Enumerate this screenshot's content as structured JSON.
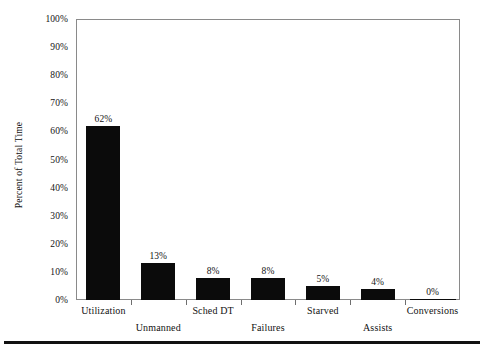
{
  "chart_data": {
    "type": "bar",
    "title": "",
    "subtitle": "",
    "xlabel": "",
    "ylabel": "Percent of Total Time",
    "categories": [
      "Utilization",
      "Unmanned",
      "Sched DT",
      "Failures",
      "Starved",
      "Assists",
      "Conversions"
    ],
    "values": [
      62,
      13,
      8,
      8,
      5,
      4,
      0
    ],
    "value_labels": [
      "62%",
      "13%",
      "8%",
      "8%",
      "5%",
      "4%",
      "0%"
    ],
    "ylim": [
      0,
      100
    ],
    "ytick_values": [
      0,
      10,
      20,
      30,
      40,
      50,
      60,
      70,
      80,
      90,
      100
    ],
    "ytick_labels": [
      "0%",
      "10%",
      "20%",
      "30%",
      "40%",
      "50%",
      "60%",
      "70%",
      "80%",
      "90%",
      "100%"
    ],
    "grid": false,
    "legend": null,
    "legend_position": "none",
    "bar_color": "#0b0b0b",
    "axis_color": "#8a8a8a",
    "background_color": "#ffffff",
    "xlabel_stagger": true,
    "annotations": []
  },
  "figure": {
    "bottom_rule": "",
    "frame_label": ""
  }
}
